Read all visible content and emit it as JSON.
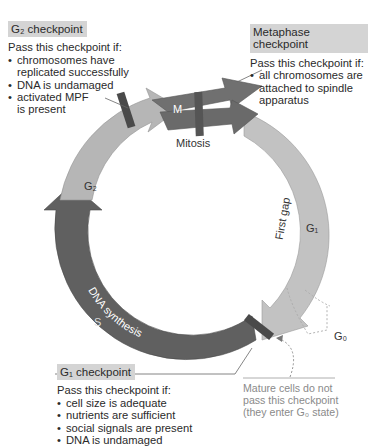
{
  "g2_checkpoint": {
    "title": "G₂ checkpoint",
    "intro": "Pass this checkpoint if:",
    "conditions": [
      "chromosomes have replicated successfully",
      "DNA is undamaged",
      "activated MPF is present"
    ]
  },
  "metaphase_checkpoint": {
    "title": "Metaphase checkpoint",
    "intro": "Pass this checkpoint if:",
    "conditions": [
      "all chromosomes are attached to spindle apparatus"
    ]
  },
  "g1_checkpoint": {
    "title": "G₁ checkpoint",
    "intro": "Pass this checkpoint if:",
    "conditions": [
      "cell size is adequate",
      "nutrients are sufficient",
      "social signals are present",
      "DNA is undamaged"
    ]
  },
  "phases": {
    "m": {
      "symbol": "M",
      "name": "Mitosis"
    },
    "g1": {
      "symbol": "G₁",
      "name": "First gap"
    },
    "s": {
      "symbol": "S",
      "name": "DNA synthesis"
    },
    "g2": {
      "symbol": "G₂",
      "name": "Second gap"
    },
    "g0": {
      "symbol": "G₀"
    }
  },
  "g0_note": "Mature cells do not pass this checkpoint (they enter G₀ state)",
  "colors": {
    "m_arrow": "#6e6e6e",
    "g1_arrow": "#bdbdbd",
    "s_arrow": "#5f5f5f",
    "g2_arrow": "#b3b3b3",
    "checkpoint_bar": "#4a4a4a",
    "header_bg": "#d4d4d4"
  }
}
